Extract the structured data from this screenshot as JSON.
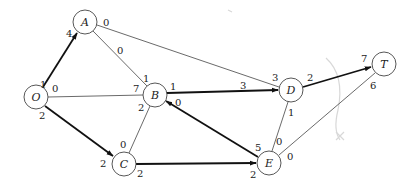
{
  "diagram": {
    "type": "network-flow-graph",
    "nodes": [
      {
        "id": "O",
        "label": "O",
        "x": 36,
        "y": 97
      },
      {
        "id": "A",
        "label": "A",
        "x": 85,
        "y": 22
      },
      {
        "id": "B",
        "label": "B",
        "x": 155,
        "y": 95
      },
      {
        "id": "C",
        "label": "C",
        "x": 124,
        "y": 164
      },
      {
        "id": "D",
        "label": "D",
        "x": 291,
        "y": 90
      },
      {
        "id": "E",
        "label": "E",
        "x": 269,
        "y": 163
      },
      {
        "id": "T",
        "label": "T",
        "x": 384,
        "y": 64
      }
    ],
    "edges": [
      {
        "from": "O",
        "to": "A",
        "directed": true,
        "label_from": "1",
        "label_to": "4"
      },
      {
        "from": "O",
        "to": "B",
        "directed": false,
        "label_from": "0",
        "label_to": "7"
      },
      {
        "from": "O",
        "to": "C",
        "directed": true,
        "label_from": "2",
        "label_to": "2"
      },
      {
        "from": "A",
        "to": "B",
        "directed": false,
        "label_from": "0",
        "label_to": "1"
      },
      {
        "from": "A",
        "to": "D",
        "directed": false,
        "label_from": "0",
        "label_to": "3"
      },
      {
        "from": "B",
        "to": "D",
        "directed": true,
        "label_from": "1",
        "label_to": "3"
      },
      {
        "from": "B",
        "to": "C",
        "directed": false,
        "label_from": "2",
        "label_to": "0"
      },
      {
        "from": "E",
        "to": "B",
        "directed": true,
        "label_from": "5",
        "label_to": "0"
      },
      {
        "from": "C",
        "to": "E",
        "directed": true,
        "label_from": "2",
        "label_to": "2"
      },
      {
        "from": "D",
        "to": "T",
        "directed": true,
        "label_from": "2",
        "label_to": "7"
      },
      {
        "from": "D",
        "to": "E",
        "directed": false,
        "label_from": "1",
        "label_to": "0"
      },
      {
        "from": "E",
        "to": "T",
        "directed": false,
        "label_from": "0",
        "label_to": "6"
      }
    ]
  },
  "labels": {
    "node_O": "O",
    "node_A": "A",
    "node_B": "B",
    "node_C": "C",
    "node_D": "D",
    "node_E": "E",
    "node_T": "T",
    "OA_from": "1",
    "OA_to": "4",
    "OB_from": "0",
    "OB_to": "7",
    "OC_from": "2",
    "OC_to": "2",
    "AB_from": "0",
    "AB_to": "1",
    "AD_from": "0",
    "AD_to": "3",
    "BD_from": "1",
    "BD_to": "3",
    "BC_from": "2",
    "BC_to": "0",
    "EB_from": "5",
    "EB_to": "0",
    "CE_from": "2",
    "CE_to": "2",
    "DT_from": "2",
    "DT_to": "7",
    "DE_from": "1",
    "DE_to": "0",
    "ET_from": "0",
    "ET_to": "6"
  }
}
